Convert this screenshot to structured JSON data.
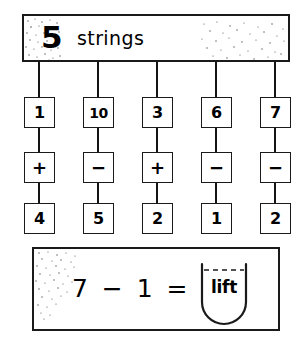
{
  "banner": {
    "count": "5",
    "label": "strings",
    "speckle_icon_left": "speckle-texture-icon",
    "speckle_icon_right": "speckle-texture-icon"
  },
  "strings": [
    {
      "top": "1",
      "operator": "+",
      "bottom": "4"
    },
    {
      "top": "10",
      "operator": "−",
      "bottom": "5"
    },
    {
      "top": "3",
      "operator": "+",
      "bottom": "2"
    },
    {
      "top": "6",
      "operator": "−",
      "bottom": "1"
    },
    {
      "top": "7",
      "operator": "−",
      "bottom": "2"
    }
  ],
  "equation": {
    "expression": "7  −  1  =",
    "answer_flap_label": "lift",
    "speckle_icon": "speckle-texture-icon",
    "flap_icon": "lift-flap-icon"
  },
  "colors": {
    "ink": "#1a1a1a",
    "paper": "#ffffff"
  }
}
